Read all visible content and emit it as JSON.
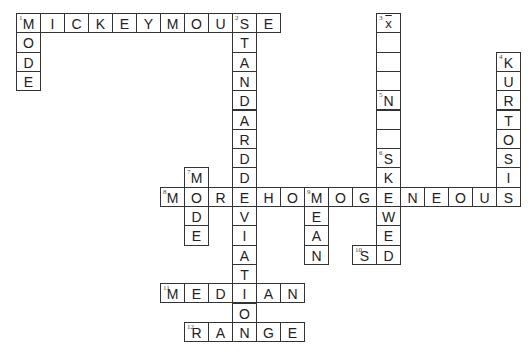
{
  "puzzle": {
    "type": "crossword",
    "grid_origin": {
      "x": 16,
      "y": 13
    },
    "cell_size": {
      "w": 24,
      "h": 19.3
    },
    "colors": {
      "border": "#333333",
      "text": "#222222",
      "background": "#ffffff"
    },
    "entries": [
      {
        "number": "1",
        "direction": "across",
        "answer": "MICKEYMOUSE",
        "row": 0,
        "col": 0
      },
      {
        "number": "1",
        "direction": "down",
        "answer": "MODE",
        "row": 0,
        "col": 0
      },
      {
        "number": "2",
        "direction": "down",
        "answer": "STANDARDDEVIATION",
        "row": 0,
        "col": 9
      },
      {
        "number": "3",
        "direction": "down",
        "answer": "x̄",
        "row": 0,
        "col": 15
      },
      {
        "number": "4",
        "direction": "down",
        "answer": "KURTOSIS",
        "row": 2,
        "col": 20
      },
      {
        "number": "5",
        "direction": "down",
        "answer": "N",
        "row": 4,
        "col": 15
      },
      {
        "number": "6",
        "direction": "down",
        "answer": "SKEWED",
        "row": 7,
        "col": 15
      },
      {
        "number": "7",
        "direction": "down",
        "answer": "MODE",
        "row": 8,
        "col": 7
      },
      {
        "number": "8",
        "direction": "across",
        "answer": "MOREHOMOGENEOUS",
        "row": 9,
        "col": 6
      },
      {
        "number": "9",
        "direction": "down",
        "answer": "MEAN",
        "row": 9,
        "col": 12
      },
      {
        "number": "10",
        "direction": "across",
        "answer": "SD",
        "row": 12,
        "col": 14
      },
      {
        "number": "11",
        "direction": "across",
        "answer": "MEDIAN",
        "row": 14,
        "col": 6
      },
      {
        "number": "12",
        "direction": "across",
        "answer": "RANGE",
        "row": 16,
        "col": 7
      }
    ],
    "cells": [
      {
        "r": 0,
        "c": 0,
        "l": "M",
        "n": "1"
      },
      {
        "r": 0,
        "c": 1,
        "l": "I"
      },
      {
        "r": 0,
        "c": 2,
        "l": "C"
      },
      {
        "r": 0,
        "c": 3,
        "l": "K"
      },
      {
        "r": 0,
        "c": 4,
        "l": "E"
      },
      {
        "r": 0,
        "c": 5,
        "l": "Y"
      },
      {
        "r": 0,
        "c": 6,
        "l": "M"
      },
      {
        "r": 0,
        "c": 7,
        "l": "O"
      },
      {
        "r": 0,
        "c": 8,
        "l": "U"
      },
      {
        "r": 0,
        "c": 9,
        "l": "S",
        "n": "2"
      },
      {
        "r": 0,
        "c": 10,
        "l": "E"
      },
      {
        "r": 1,
        "c": 0,
        "l": "O"
      },
      {
        "r": 2,
        "c": 0,
        "l": "D"
      },
      {
        "r": 3,
        "c": 0,
        "l": "E"
      },
      {
        "r": 1,
        "c": 9,
        "l": "T"
      },
      {
        "r": 2,
        "c": 9,
        "l": "A"
      },
      {
        "r": 3,
        "c": 9,
        "l": "N"
      },
      {
        "r": 4,
        "c": 9,
        "l": "D"
      },
      {
        "r": 5,
        "c": 9,
        "l": "A"
      },
      {
        "r": 6,
        "c": 9,
        "l": "R"
      },
      {
        "r": 7,
        "c": 9,
        "l": "D"
      },
      {
        "r": 8,
        "c": 9,
        "l": "D"
      },
      {
        "r": 10,
        "c": 9,
        "l": "V"
      },
      {
        "r": 11,
        "c": 9,
        "l": "I"
      },
      {
        "r": 12,
        "c": 9,
        "l": "A"
      },
      {
        "r": 13,
        "c": 9,
        "l": "T"
      },
      {
        "r": 15,
        "c": 9,
        "l": "O"
      },
      {
        "r": 0,
        "c": 15,
        "l": "x",
        "n": "3",
        "xbar": true
      },
      {
        "r": 1,
        "c": 15,
        "l": ""
      },
      {
        "r": 2,
        "c": 15,
        "l": ""
      },
      {
        "r": 3,
        "c": 15,
        "l": ""
      },
      {
        "r": 4,
        "c": 15,
        "l": "N",
        "n": "5"
      },
      {
        "r": 5,
        "c": 15,
        "l": ""
      },
      {
        "r": 6,
        "c": 15,
        "l": ""
      },
      {
        "r": 7,
        "c": 15,
        "l": "S",
        "n": "6"
      },
      {
        "r": 8,
        "c": 15,
        "l": "K"
      },
      {
        "r": 10,
        "c": 15,
        "l": "W"
      },
      {
        "r": 11,
        "c": 15,
        "l": "E"
      },
      {
        "r": 2,
        "c": 20,
        "l": "K",
        "n": "4"
      },
      {
        "r": 3,
        "c": 20,
        "l": "U"
      },
      {
        "r": 4,
        "c": 20,
        "l": "R"
      },
      {
        "r": 5,
        "c": 20,
        "l": "T"
      },
      {
        "r": 6,
        "c": 20,
        "l": "O"
      },
      {
        "r": 7,
        "c": 20,
        "l": "S"
      },
      {
        "r": 8,
        "c": 20,
        "l": "I"
      },
      {
        "r": 8,
        "c": 7,
        "l": "M",
        "n": "7"
      },
      {
        "r": 10,
        "c": 7,
        "l": "D"
      },
      {
        "r": 11,
        "c": 7,
        "l": "E"
      },
      {
        "r": 9,
        "c": 6,
        "l": "M",
        "n": "8"
      },
      {
        "r": 9,
        "c": 7,
        "l": "O"
      },
      {
        "r": 9,
        "c": 8,
        "l": "R"
      },
      {
        "r": 9,
        "c": 9,
        "l": "E"
      },
      {
        "r": 9,
        "c": 10,
        "l": "H"
      },
      {
        "r": 9,
        "c": 11,
        "l": "O"
      },
      {
        "r": 9,
        "c": 12,
        "l": "M",
        "n": "9"
      },
      {
        "r": 9,
        "c": 13,
        "l": "O"
      },
      {
        "r": 9,
        "c": 14,
        "l": "G"
      },
      {
        "r": 9,
        "c": 15,
        "l": "E"
      },
      {
        "r": 9,
        "c": 16,
        "l": "N"
      },
      {
        "r": 9,
        "c": 17,
        "l": "E"
      },
      {
        "r": 9,
        "c": 18,
        "l": "O"
      },
      {
        "r": 9,
        "c": 19,
        "l": "U"
      },
      {
        "r": 9,
        "c": 20,
        "l": "S"
      },
      {
        "r": 10,
        "c": 12,
        "l": "E"
      },
      {
        "r": 11,
        "c": 12,
        "l": "A"
      },
      {
        "r": 12,
        "c": 12,
        "l": "N"
      },
      {
        "r": 12,
        "c": 14,
        "l": "S",
        "n": "10"
      },
      {
        "r": 12,
        "c": 15,
        "l": "D"
      },
      {
        "r": 14,
        "c": 6,
        "l": "M",
        "n": "11"
      },
      {
        "r": 14,
        "c": 7,
        "l": "E"
      },
      {
        "r": 14,
        "c": 8,
        "l": "D"
      },
      {
        "r": 14,
        "c": 9,
        "l": "I"
      },
      {
        "r": 14,
        "c": 10,
        "l": "A"
      },
      {
        "r": 14,
        "c": 11,
        "l": "N"
      },
      {
        "r": 16,
        "c": 7,
        "l": "R",
        "n": "12"
      },
      {
        "r": 16,
        "c": 8,
        "l": "A"
      },
      {
        "r": 16,
        "c": 9,
        "l": "N"
      },
      {
        "r": 16,
        "c": 10,
        "l": "G"
      },
      {
        "r": 16,
        "c": 11,
        "l": "E"
      }
    ]
  }
}
